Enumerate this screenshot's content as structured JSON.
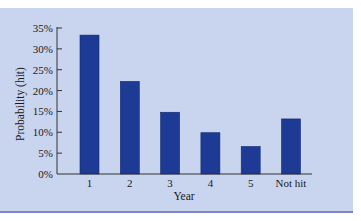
{
  "chart_data": {
    "type": "bar",
    "title": "",
    "xlabel": "Year",
    "ylabel": "Probability (hit)",
    "categories": [
      "1",
      "2",
      "3",
      "4",
      "5",
      "Not hit"
    ],
    "values": [
      33.3,
      22.2,
      14.8,
      9.9,
      6.6,
      13.2
    ],
    "value_unit": "%",
    "ylim": [
      0,
      35
    ],
    "yticks": [
      0,
      5,
      10,
      15,
      20,
      25,
      30,
      35
    ],
    "ytick_labels": [
      "0%",
      "5%",
      "10%",
      "15%",
      "20%",
      "25%",
      "30%",
      "35%"
    ],
    "grid": false,
    "legend": null,
    "colors": {
      "bar": "#1d3a94",
      "background": "#c9d4ef",
      "axis": "#333333",
      "bottom_rule": "#7d87c8"
    }
  }
}
